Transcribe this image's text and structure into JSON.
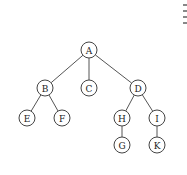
{
  "diagram": {
    "type": "tree",
    "nodes": [
      {
        "id": "A",
        "label": "A",
        "x": 89,
        "y": 50
      },
      {
        "id": "B",
        "label": "B",
        "x": 45,
        "y": 88
      },
      {
        "id": "C",
        "label": "C",
        "x": 89,
        "y": 88
      },
      {
        "id": "D",
        "label": "D",
        "x": 138,
        "y": 88
      },
      {
        "id": "E",
        "label": "E",
        "x": 27,
        "y": 118
      },
      {
        "id": "F",
        "label": "F",
        "x": 62,
        "y": 118
      },
      {
        "id": "H",
        "label": "H",
        "x": 122,
        "y": 118
      },
      {
        "id": "I",
        "label": "I",
        "x": 157,
        "y": 118
      },
      {
        "id": "G",
        "label": "G",
        "x": 122,
        "y": 145
      },
      {
        "id": "K",
        "label": "K",
        "x": 157,
        "y": 145
      }
    ],
    "edges": [
      [
        "A",
        "B"
      ],
      [
        "A",
        "C"
      ],
      [
        "A",
        "D"
      ],
      [
        "B",
        "E"
      ],
      [
        "B",
        "F"
      ],
      [
        "D",
        "H"
      ],
      [
        "D",
        "I"
      ],
      [
        "H",
        "G"
      ],
      [
        "I",
        "K"
      ]
    ]
  }
}
